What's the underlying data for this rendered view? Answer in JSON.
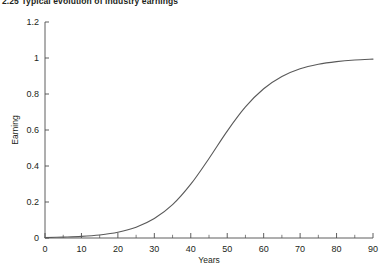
{
  "figure": {
    "title": "2.25  Typical evolution of industry earnings"
  },
  "chart_data": {
    "type": "line",
    "title": "2.25  Typical evolution of industry earnings",
    "xlabel": "Years",
    "ylabel": "Earning",
    "xlim": [
      0,
      90
    ],
    "ylim": [
      0,
      1.2
    ],
    "grid": false,
    "legend": null,
    "line_color": "#595959",
    "xticks": [
      0,
      10,
      20,
      30,
      40,
      50,
      60,
      70,
      80,
      90
    ],
    "xtick_labels": [
      "0",
      "10",
      "20",
      "30",
      "40",
      "50",
      "60",
      "70",
      "80",
      "90"
    ],
    "xminor_ticks": [
      5,
      15,
      25,
      35,
      45,
      55,
      65,
      75,
      85
    ],
    "yticks": [
      0,
      0.2,
      0.4,
      0.6,
      0.8,
      1,
      1.2
    ],
    "ytick_labels": [
      "0",
      "0.2",
      "0.4",
      "0.6",
      "0.8",
      "1",
      "1.2"
    ],
    "series": [
      {
        "name": "Industry earnings",
        "x": [
          0,
          5,
          10,
          15,
          20,
          25,
          30,
          35,
          40,
          45,
          50,
          55,
          60,
          65,
          70,
          75,
          80,
          85,
          90
        ],
        "values": [
          0.002,
          0.005,
          0.009,
          0.017,
          0.032,
          0.06,
          0.108,
          0.185,
          0.299,
          0.442,
          0.594,
          0.728,
          0.829,
          0.897,
          0.94,
          0.965,
          0.98,
          0.989,
          0.994
        ]
      }
    ]
  }
}
